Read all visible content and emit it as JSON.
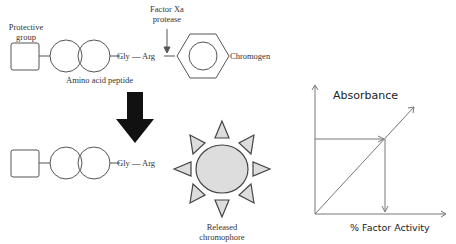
{
  "substrate": {
    "protective_group_label": [
      "Protective",
      "group"
    ],
    "peptide_label": "Amino acid peptide",
    "residues": [
      "Gly",
      "Arg"
    ],
    "bond": "—",
    "enzyme_label": [
      "Factor Xa",
      "protease"
    ],
    "chromogen_label": "Chromogen"
  },
  "product": {
    "residues": [
      "Gly",
      "Arg"
    ],
    "bond": "—",
    "chromophore_label": [
      "Released",
      "chromophore"
    ]
  },
  "graph": {
    "y_axis_label": "Absorbance",
    "x_axis_label": "% Factor Activity"
  },
  "colors": {
    "line": "#555555",
    "arrow": "#111111",
    "sun_fill": "#dddddd",
    "graph_line": "#777777"
  }
}
